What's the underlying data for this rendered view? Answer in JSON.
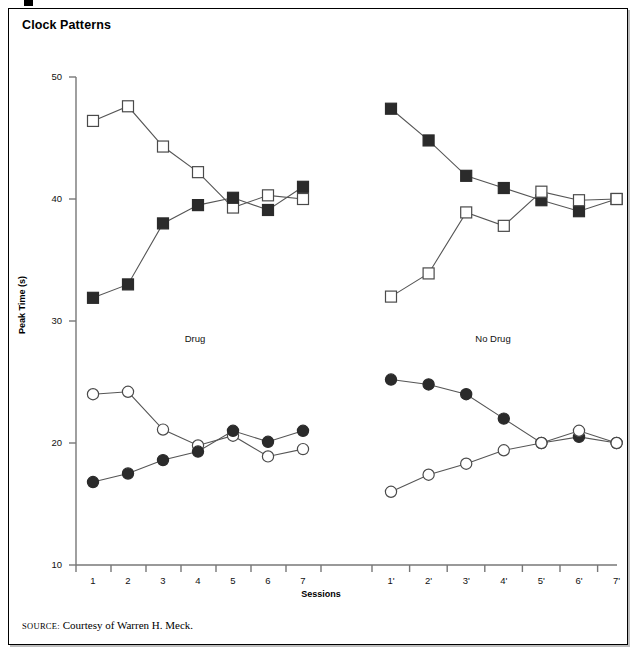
{
  "figure": {
    "title": "Clock Patterns",
    "source_prefix": "SOURCE:",
    "source_text": "Courtesy of Warren H. Meck."
  },
  "chart_data": {
    "type": "line",
    "title": "Clock Patterns",
    "xlabel": "Sessions",
    "ylabel": "Peak Time (s)",
    "ylim": [
      10,
      50
    ],
    "yticks": [
      10,
      20,
      30,
      40,
      50
    ],
    "grid": false,
    "legend": "none",
    "panels": [
      {
        "name": "Drug",
        "label": "Drug",
        "categories": [
          "1",
          "2",
          "3",
          "4",
          "5",
          "6",
          "7"
        ],
        "series": [
          {
            "name": "open-square-drug",
            "marker": "open-square",
            "values": [
              46.4,
              47.6,
              44.3,
              42.2,
              39.3,
              40.3,
              40.0
            ]
          },
          {
            "name": "filled-square-drug",
            "marker": "filled-square",
            "values": [
              31.9,
              33.0,
              38.0,
              39.5,
              40.1,
              39.1,
              41.0
            ]
          },
          {
            "name": "open-circle-drug",
            "marker": "open-circle",
            "values": [
              24.0,
              24.2,
              21.1,
              19.8,
              20.6,
              18.9,
              19.5
            ]
          },
          {
            "name": "filled-circle-drug",
            "marker": "filled-circle",
            "values": [
              16.8,
              17.5,
              18.6,
              19.3,
              21.0,
              20.1,
              21.0
            ]
          }
        ]
      },
      {
        "name": "No Drug",
        "label": "No  Drug",
        "categories": [
          "1'",
          "2'",
          "3'",
          "4'",
          "5'",
          "6'",
          "7'"
        ],
        "series": [
          {
            "name": "filled-square-nodrug",
            "marker": "filled-square",
            "values": [
              47.4,
              44.8,
              41.9,
              40.9,
              39.9,
              39.0,
              40.0
            ]
          },
          {
            "name": "open-square-nodrug",
            "marker": "open-square",
            "values": [
              32.0,
              33.9,
              38.9,
              37.8,
              40.6,
              39.9,
              40.0
            ]
          },
          {
            "name": "filled-circle-nodrug",
            "marker": "filled-circle",
            "values": [
              25.2,
              24.8,
              24.0,
              22.0,
              20.0,
              20.5,
              20.0
            ]
          },
          {
            "name": "open-circle-nodrug",
            "marker": "open-circle",
            "values": [
              16.0,
              17.4,
              18.3,
              19.4,
              20.0,
              21.0,
              20.0
            ]
          }
        ]
      }
    ],
    "colors": {
      "line": "#555555",
      "marker_fill": "#2b2b2b",
      "marker_open": "#ffffff",
      "axis": "#777777",
      "text": "#111111"
    }
  },
  "geometry": {
    "y_top_px": 77,
    "y_bottom_px": 565,
    "y_top_val": 50,
    "y_bottom_val": 10,
    "axis_x_px": 76,
    "left_panel_x0": 93,
    "left_panel_dx": 35,
    "right_panel_x0": 391,
    "right_panel_dx": 37.6,
    "left_tick_x0": 76,
    "right_tick_x0": 372
  }
}
